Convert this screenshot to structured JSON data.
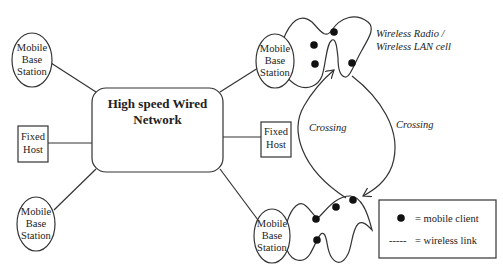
{
  "diagram": {
    "network": {
      "label_line1": "High speed Wired",
      "label_line2": "Network"
    },
    "base_stations": [
      {
        "id": "mbs-left-top",
        "line1": "Mobile",
        "line2": "Base",
        "line3": "Station"
      },
      {
        "id": "mbs-left-bottom",
        "line1": "Mobile",
        "line2": "Base",
        "line3": "Station"
      },
      {
        "id": "mbs-right-top",
        "line1": "Mobile",
        "line2": "Base",
        "line3": "Station"
      },
      {
        "id": "mbs-right-bottom",
        "line1": "Mobile",
        "line2": "Base",
        "line3": "Station"
      }
    ],
    "fixed_hosts": [
      {
        "id": "fh-left",
        "line1": "Fixed",
        "line2": "Host"
      },
      {
        "id": "fh-right",
        "line1": "Fixed",
        "line2": "Host"
      }
    ],
    "cell_label": {
      "line1": "Wireless Radio /",
      "line2": "Wireless LAN cell"
    },
    "crossing_labels": [
      "Crossing",
      "Crossing"
    ],
    "legend": {
      "mobile_client": "= mobile client",
      "wireless_link_symbol": "-----",
      "wireless_link": "= wireless link"
    }
  }
}
